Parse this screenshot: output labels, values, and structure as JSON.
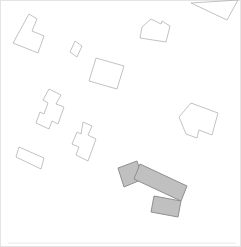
{
  "canvas": {
    "width": 241,
    "height": 247,
    "background": "#ffffff",
    "frame_color": "#e4e4e4",
    "baseline_color": "#e9e9e9"
  },
  "map": {
    "palette": {
      "outline_stroke": "#b3b3b3",
      "outline_fill": "none",
      "highlight_fill": "#c0c0c0",
      "highlight_stroke": "#8f8f8f"
    },
    "buildings": [
      {
        "name": "building-outline-l-shape-top-left",
        "role": "outline",
        "points": "29,14 37,19 32,31 44,36 38,53 13,43"
      },
      {
        "name": "building-outline-small-square",
        "role": "outline",
        "points": "75,41 82,46 77,57 70,52"
      },
      {
        "name": "building-outline-rect-top-middle",
        "role": "outline",
        "points": "96,58 124,66 117,89 89,81"
      },
      {
        "name": "building-outline-notched-top-right",
        "role": "outline",
        "points": "151,19 161,24 162,21 170,26 166,42 140,38 142,27"
      },
      {
        "name": "building-outline-triangle-top-corner",
        "role": "outline",
        "points": "191,3 238,0 227,20"
      },
      {
        "name": "building-outline-zigzag-left",
        "role": "outline",
        "points": "49,89 61,95 56,104 64,107 58,124 52,121 49,129 36,123 40,112 44,114 48,103 43,100"
      },
      {
        "name": "building-outline-zigzag-middle",
        "role": "outline",
        "points": "83,122 92,126 88,135 96,139 88,161 76,155 79,147 72,144 77,132 81,134"
      },
      {
        "name": "building-outline-rect-bottom-left",
        "role": "outline",
        "points": "19,147 44,158 41,169 16,157"
      },
      {
        "name": "building-outline-large-right-notched",
        "role": "outline",
        "points": "191,103 218,113 212,135 199,130 197,138 186,134 179,117"
      },
      {
        "name": "highlighted-building-west-wing",
        "role": "highlight",
        "points": "118,168 137,161 143,179 124,187"
      },
      {
        "name": "highlighted-building-main-block",
        "role": "highlight",
        "points": "140,164 187,186 181,201 134,179"
      },
      {
        "name": "highlighted-building-south-wing",
        "role": "highlight",
        "points": "154,196 181,201 178,217 151,212"
      }
    ]
  }
}
